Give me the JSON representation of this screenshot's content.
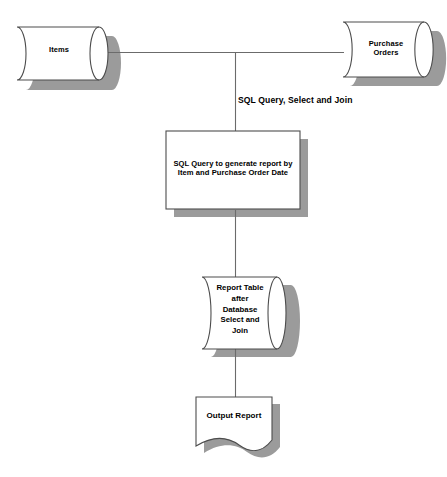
{
  "diagram": {
    "background_color": "#ffffff",
    "stroke_color": "#4d4d4d",
    "shadow_color": "#9b9b9b",
    "fill_color": "#ffffff",
    "text_color": "#000000",
    "nodes": {
      "items_db": {
        "label": "Items",
        "shape": "cylinder-horizontal"
      },
      "purchase_orders_db": {
        "label": "Purchase\nOrders",
        "shape": "cylinder-horizontal"
      },
      "process_box": {
        "label": "SQL Query to generate report by\nItem and Purchase Order Date",
        "shape": "rectangle"
      },
      "report_table_db": {
        "label": "Report Table\nafter\nDatabase\nSelect and\nJoin",
        "shape": "cylinder-horizontal"
      },
      "output_report_doc": {
        "label": "Output Report",
        "shape": "document"
      }
    },
    "connectors": {
      "join_caption": "SQL Query, Select and Join"
    }
  }
}
